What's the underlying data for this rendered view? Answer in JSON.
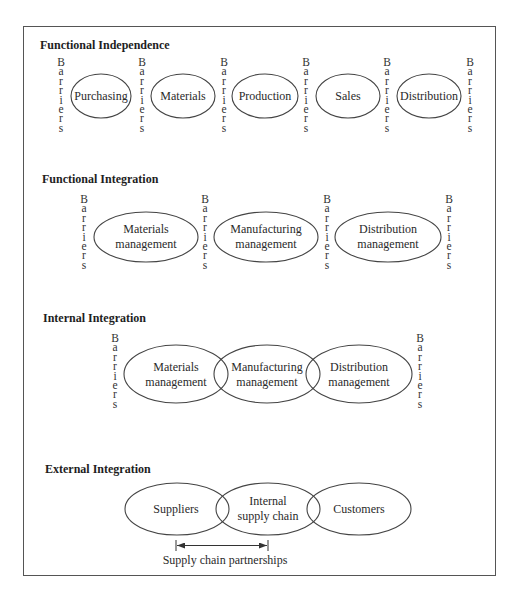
{
  "sections": [
    {
      "title": "Functional Independence",
      "barrier_label": "Barriers",
      "nodes": [
        {
          "label": "Purchasing"
        },
        {
          "label": "Materials"
        },
        {
          "label": "Production"
        },
        {
          "label": "Sales"
        },
        {
          "label": "Distribution"
        }
      ]
    },
    {
      "title": "Functional Integration",
      "barrier_label": "Barriers",
      "nodes": [
        {
          "line1": "Materials",
          "line2": "management"
        },
        {
          "line1": "Manufacturing",
          "line2": "management"
        },
        {
          "line1": "Distribution",
          "line2": "management"
        }
      ]
    },
    {
      "title": "Internal Integration",
      "barrier_label": "Barriers",
      "nodes": [
        {
          "line1": "Materials",
          "line2": "management"
        },
        {
          "line1": "Manufacturing",
          "line2": "management"
        },
        {
          "line1": "Distribution",
          "line2": "management"
        }
      ]
    },
    {
      "title": "External Integration",
      "nodes": [
        {
          "label": "Suppliers"
        },
        {
          "line1": "Internal",
          "line2": "supply chain"
        },
        {
          "label": "Customers"
        }
      ],
      "span_label": "Supply chain partnerships"
    }
  ],
  "colors": {
    "stroke": "#444444",
    "text": "#2a2a2a",
    "frame": "#555555"
  }
}
